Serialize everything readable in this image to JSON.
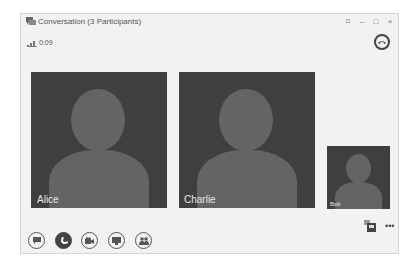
{
  "window": {
    "title": "Conversation (3 Participants)",
    "controls": [
      "pop-out",
      "minimize",
      "maximize",
      "close"
    ],
    "control_glyphs": {
      "popout": "⌑",
      "minimize": "–",
      "maximize": "□",
      "close": "×"
    }
  },
  "call": {
    "duration": "0:09"
  },
  "participants": [
    {
      "name": "Alice"
    },
    {
      "name": "Charlie"
    },
    {
      "name": "Bob"
    }
  ],
  "toolbar": {
    "buttons": [
      "im",
      "call",
      "video",
      "present",
      "participants"
    ]
  },
  "more_label": "•••",
  "colors": {
    "tile_bg": "#3f3f3f",
    "avatar": "#646464",
    "window_bg": "#f2f2f2"
  }
}
